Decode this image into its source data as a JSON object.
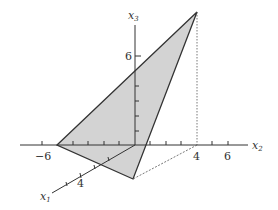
{
  "diagram": {
    "type": "3d-coordinate-plot",
    "axes": {
      "x1": {
        "label": "x",
        "subscript": "1",
        "ticks": [
          "4"
        ]
      },
      "x2": {
        "label": "x",
        "subscript": "2",
        "ticks": [
          "-6",
          "4",
          "6"
        ]
      },
      "x3": {
        "label": "x",
        "subscript": "3",
        "ticks": [
          "6"
        ]
      }
    },
    "tick_labels": {
      "x2_neg6": "−6",
      "x2_4": "4",
      "x2_6": "6",
      "x3_6": "6",
      "x1_4": "4"
    },
    "shape": {
      "kind": "triangle",
      "fill": "#d3d3d3",
      "stroke": "#333333"
    }
  }
}
